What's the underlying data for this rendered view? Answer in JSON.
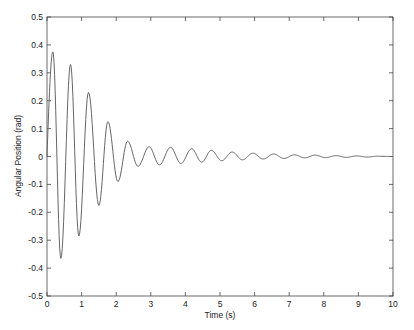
{
  "chart_data": {
    "type": "line",
    "title": "",
    "xlabel": "Time (s)",
    "ylabel": "Angular Position (rad)",
    "xlim": [
      0,
      10
    ],
    "ylim": [
      -0.5,
      0.5
    ],
    "xticks": [
      0,
      1,
      2,
      3,
      4,
      5,
      6,
      7,
      8,
      9,
      10
    ],
    "yticks": [
      -0.5,
      -0.4,
      -0.3,
      -0.2,
      -0.1,
      0,
      0.1,
      0.2,
      0.3,
      0.4,
      0.5
    ],
    "xtick_labels": [
      "0",
      "1",
      "2",
      "3",
      "4",
      "5",
      "6",
      "7",
      "8",
      "9",
      "10"
    ],
    "ytick_labels": [
      "-0.5",
      "-0.4",
      "-0.3",
      "-0.2",
      "-0.1",
      "0",
      "0.1",
      "0.2",
      "0.3",
      "0.4",
      "0.5"
    ],
    "grid": false,
    "legend": null,
    "line_color": "#666666",
    "series": [
      {
        "name": "angular_position",
        "x": [
          0,
          0.17,
          0.4,
          0.68,
          0.92,
          1.2,
          1.5,
          1.76,
          2.05,
          2.33,
          2.63,
          2.95,
          3.25,
          3.57,
          3.87,
          4.18,
          4.47,
          4.75,
          5.05,
          5.35,
          5.65,
          5.95,
          6.25,
          6.55,
          6.85,
          7.15,
          7.45,
          7.75,
          8.05,
          8.35,
          8.65,
          8.95,
          9.25,
          9.55,
          10.0
        ],
        "y": [
          0,
          0.375,
          -0.365,
          0.33,
          -0.285,
          0.23,
          -0.175,
          0.125,
          -0.09,
          0.055,
          -0.035,
          0.035,
          -0.03,
          0.033,
          -0.025,
          0.028,
          -0.02,
          0.022,
          -0.015,
          0.016,
          -0.012,
          0.012,
          -0.009,
          0.009,
          -0.007,
          0.006,
          -0.005,
          0.005,
          -0.004,
          0.003,
          -0.003,
          0.002,
          -0.002,
          0.001,
          0
        ]
      }
    ]
  }
}
